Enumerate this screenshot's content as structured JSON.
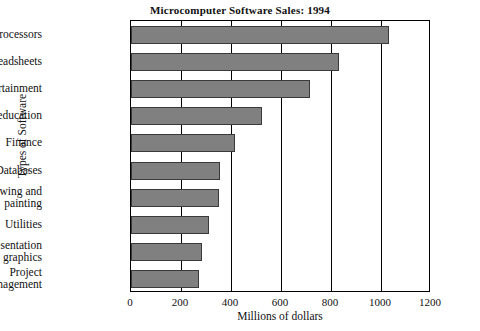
{
  "chart_data": {
    "type": "bar",
    "orientation": "horizontal",
    "title": "Microcomputer Software Sales: 1994",
    "xlabel": "Millions of dollars",
    "ylabel": "Types of Software",
    "categories": [
      "Word processors",
      "Spreadsheets",
      "Entertainment",
      "Home education",
      "Finance",
      "Databases",
      "Drawing and\npainting",
      "Utilities",
      "Presentation\ngraphics",
      "Project\nmanagement"
    ],
    "category_lines": [
      [
        "Word processors"
      ],
      [
        "Spreadsheets"
      ],
      [
        "Entertainment"
      ],
      [
        "Home education"
      ],
      [
        "Finance"
      ],
      [
        "Databases"
      ],
      [
        "Drawing and",
        "painting"
      ],
      [
        "Utilities"
      ],
      [
        "Presentation",
        "graphics"
      ],
      [
        "Project",
        "management"
      ]
    ],
    "values": [
      1030,
      830,
      715,
      525,
      415,
      355,
      350,
      310,
      285,
      270
    ],
    "xlim": [
      0,
      1200
    ],
    "xticks": [
      0,
      200,
      400,
      600,
      800,
      1000,
      1200
    ],
    "xtick_labels": [
      "0",
      "200",
      "400",
      "600",
      "800",
      "1000",
      "1200"
    ],
    "grid": true,
    "grid_axis": "x",
    "legend": null,
    "bar_color": "#808080",
    "bar_edge_color": "#3a3a3a",
    "axis_color": "#000000"
  }
}
